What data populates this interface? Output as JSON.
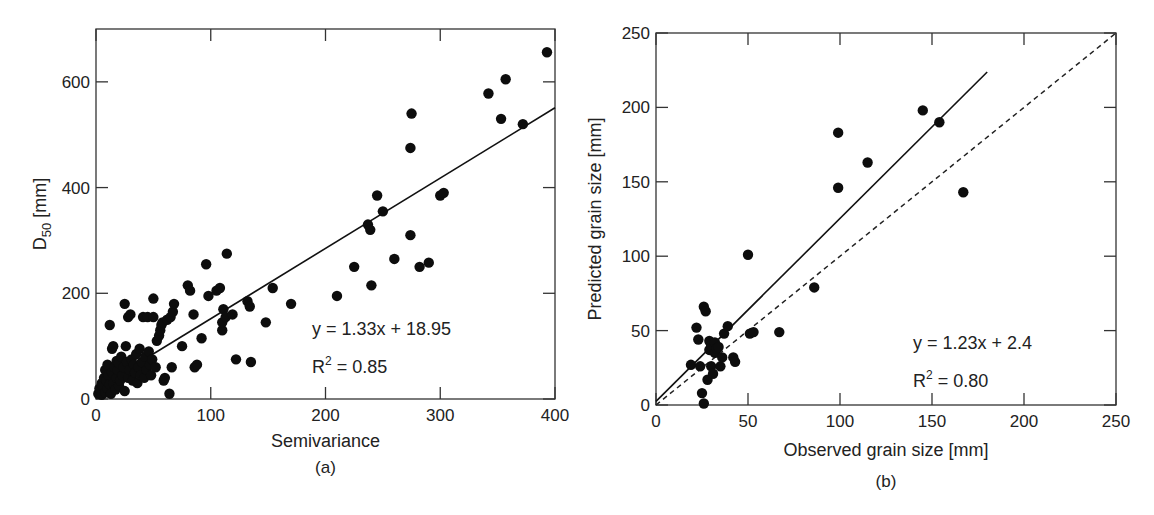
{
  "chart_data": [
    {
      "panel": "(a)",
      "type": "scatter",
      "title": "",
      "xlabel": "Semivariance",
      "ylabel": "D50 [mm]",
      "ylabel_main": "D",
      "ylabel_sub": "50",
      "ylabel_unit": " [mm]",
      "xlim": [
        0,
        400
      ],
      "ylim": [
        0,
        700
      ],
      "xticks": [
        0,
        100,
        200,
        300,
        400
      ],
      "yticks": [
        0,
        200,
        400,
        600
      ],
      "grid": false,
      "caption": "(a)",
      "fit": {
        "label": "y = 1.33x + 18.95",
        "r2_label": "R",
        "r2_sup": "2",
        "r2_value": " = 0.85",
        "slope": 1.33,
        "intercept": 18.95,
        "x_range": [
          0,
          400
        ]
      },
      "points": [
        [
          2,
          10
        ],
        [
          3,
          20
        ],
        [
          4,
          15
        ],
        [
          5,
          30
        ],
        [
          5,
          8
        ],
        [
          6,
          25
        ],
        [
          7,
          40
        ],
        [
          8,
          12
        ],
        [
          8,
          55
        ],
        [
          9,
          35
        ],
        [
          10,
          20
        ],
        [
          10,
          65
        ],
        [
          11,
          45
        ],
        [
          12,
          28
        ],
        [
          12,
          140
        ],
        [
          13,
          10
        ],
        [
          14,
          50
        ],
        [
          14,
          95
        ],
        [
          15,
          30
        ],
        [
          15,
          100
        ],
        [
          16,
          60
        ],
        [
          17,
          18
        ],
        [
          18,
          40
        ],
        [
          18,
          72
        ],
        [
          19,
          55
        ],
        [
          20,
          25
        ],
        [
          20,
          68
        ],
        [
          21,
          35
        ],
        [
          22,
          80
        ],
        [
          23,
          45
        ],
        [
          24,
          60
        ],
        [
          25,
          15
        ],
        [
          25,
          180
        ],
        [
          26,
          100
        ],
        [
          27,
          70
        ],
        [
          28,
          40
        ],
        [
          28,
          155
        ],
        [
          29,
          55
        ],
        [
          30,
          160
        ],
        [
          31,
          75
        ],
        [
          32,
          35
        ],
        [
          33,
          65
        ],
        [
          34,
          50
        ],
        [
          35,
          85
        ],
        [
          36,
          30
        ],
        [
          37,
          60
        ],
        [
          38,
          95
        ],
        [
          39,
          45
        ],
        [
          40,
          70
        ],
        [
          41,
          155
        ],
        [
          42,
          40
        ],
        [
          43,
          80
        ],
        [
          44,
          55
        ],
        [
          45,
          155
        ],
        [
          46,
          90
        ],
        [
          47,
          65
        ],
        [
          48,
          45
        ],
        [
          49,
          75
        ],
        [
          50,
          190
        ],
        [
          50,
          155
        ],
        [
          52,
          60
        ],
        [
          53,
          110
        ],
        [
          55,
          120
        ],
        [
          56,
          130
        ],
        [
          57,
          140
        ],
        [
          58,
          145
        ],
        [
          59,
          35
        ],
        [
          60,
          40
        ],
        [
          62,
          150
        ],
        [
          64,
          10
        ],
        [
          65,
          155
        ],
        [
          66,
          60
        ],
        [
          67,
          165
        ],
        [
          68,
          180
        ],
        [
          75,
          100
        ],
        [
          80,
          215
        ],
        [
          82,
          205
        ],
        [
          85,
          160
        ],
        [
          86,
          60
        ],
        [
          88,
          65
        ],
        [
          92,
          115
        ],
        [
          96,
          255
        ],
        [
          98,
          195
        ],
        [
          105,
          205
        ],
        [
          108,
          210
        ],
        [
          110,
          130
        ],
        [
          110,
          145
        ],
        [
          111,
          170
        ],
        [
          113,
          155
        ],
        [
          114,
          275
        ],
        [
          119,
          160
        ],
        [
          122,
          75
        ],
        [
          132,
          185
        ],
        [
          134,
          175
        ],
        [
          135,
          70
        ],
        [
          148,
          145
        ],
        [
          154,
          210
        ],
        [
          170,
          180
        ],
        [
          210,
          195
        ],
        [
          225,
          250
        ],
        [
          237,
          330
        ],
        [
          239,
          320
        ],
        [
          240,
          215
        ],
        [
          245,
          385
        ],
        [
          250,
          355
        ],
        [
          260,
          265
        ],
        [
          274,
          310
        ],
        [
          274,
          475
        ],
        [
          275,
          540
        ],
        [
          282,
          250
        ],
        [
          290,
          258
        ],
        [
          300,
          385
        ],
        [
          303,
          390
        ],
        [
          342,
          578
        ],
        [
          353,
          530
        ],
        [
          357,
          605
        ],
        [
          372,
          520
        ],
        [
          393,
          656
        ]
      ]
    },
    {
      "panel": "(b)",
      "type": "scatter",
      "title": "",
      "xlabel": "Observed grain size [mm]",
      "ylabel": "Predicted grain size [mm]",
      "xlim": [
        0,
        250
      ],
      "ylim": [
        0,
        250
      ],
      "xticks": [
        0,
        50,
        100,
        150,
        200,
        250
      ],
      "yticks": [
        0,
        50,
        100,
        150,
        200,
        250
      ],
      "grid": false,
      "caption": "(b)",
      "fit": {
        "label": "y = 1.23x + 2.4",
        "r2_label": "R",
        "r2_sup": "2",
        "r2_value": " = 0.80",
        "slope": 1.23,
        "intercept": 2.4,
        "x_range": [
          0,
          180
        ]
      },
      "reference_line": {
        "style": "dashed",
        "label": "1:1",
        "x_range": [
          0,
          250
        ]
      },
      "points": [
        [
          19,
          27
        ],
        [
          22,
          52
        ],
        [
          23,
          44
        ],
        [
          24,
          26
        ],
        [
          25,
          8
        ],
        [
          26,
          1
        ],
        [
          26,
          66
        ],
        [
          27,
          63
        ],
        [
          28,
          17
        ],
        [
          29,
          37
        ],
        [
          29,
          43
        ],
        [
          30,
          26
        ],
        [
          30,
          40
        ],
        [
          31,
          21
        ],
        [
          32,
          35
        ],
        [
          32,
          42
        ],
        [
          33,
          38
        ],
        [
          34,
          39
        ],
        [
          35,
          26
        ],
        [
          36,
          32
        ],
        [
          37,
          48
        ],
        [
          39,
          53
        ],
        [
          42,
          32
        ],
        [
          43,
          29
        ],
        [
          50,
          101
        ],
        [
          51,
          48
        ],
        [
          53,
          49
        ],
        [
          67,
          49
        ],
        [
          86,
          79
        ],
        [
          99,
          183
        ],
        [
          99,
          146
        ],
        [
          115,
          163
        ],
        [
          145,
          198
        ],
        [
          154,
          190
        ],
        [
          167,
          143
        ]
      ]
    }
  ]
}
